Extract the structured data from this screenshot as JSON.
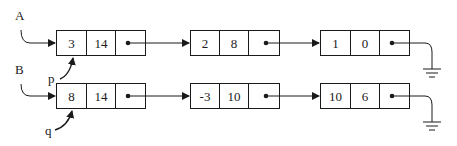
{
  "diagram": {
    "type": "linked-list",
    "lists": [
      {
        "head_label": "A",
        "nodes": [
          {
            "coef": "3",
            "exp": "14"
          },
          {
            "coef": "2",
            "exp": "8"
          },
          {
            "coef": "1",
            "exp": "0"
          }
        ],
        "terminator": "null-ground"
      },
      {
        "head_label": "B",
        "nodes": [
          {
            "coef": "8",
            "exp": "14"
          },
          {
            "coef": "-3",
            "exp": "10"
          },
          {
            "coef": "10",
            "exp": "6"
          }
        ],
        "terminator": "null-ground"
      }
    ],
    "pointers": [
      {
        "label": "p",
        "points_to": "A.nodes.0"
      },
      {
        "label": "q",
        "points_to": "B.nodes.0"
      }
    ],
    "colors": {
      "stroke": "#1a1a1a",
      "background": "#ffffff"
    }
  }
}
